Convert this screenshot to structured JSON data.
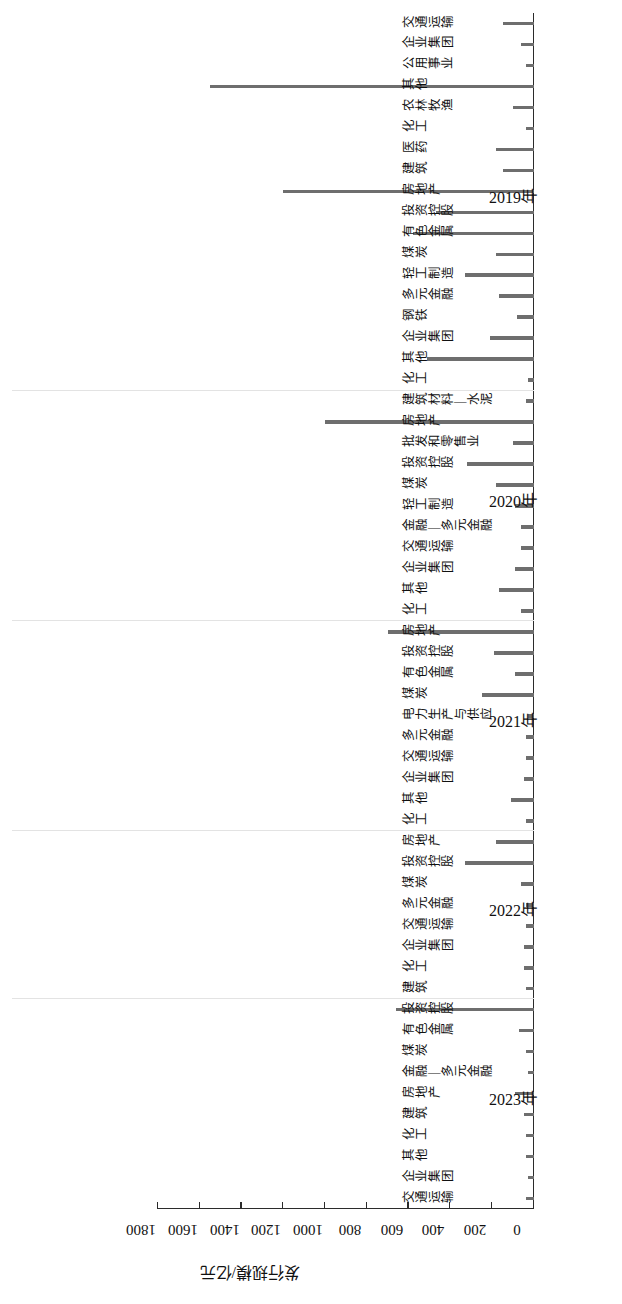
{
  "chart_data": {
    "type": "bar",
    "orientation": "horizontal",
    "title": "",
    "xlabel": "",
    "ylabel": "发行规模/亿元",
    "ylim": [
      0,
      1800
    ],
    "yticks": [
      0,
      200,
      400,
      600,
      800,
      1000,
      1200,
      1400,
      1600,
      1800
    ],
    "grid": false,
    "legend": null,
    "bar_color": "#6e6e6e",
    "group_label_suffix": "年",
    "groups": [
      {
        "year": "2019年",
        "categories": [
          "交通运输",
          "企业集团",
          "公用事业",
          "其他",
          "农林牧渔",
          "化工",
          "医药",
          "建筑",
          "房地产",
          "投资控股",
          "有色金属",
          "煤炭",
          "轻工制造",
          "多元金融",
          "钢铁",
          "企业集团",
          "其他",
          "化工"
        ],
        "values": [
          150,
          60,
          40,
          1550,
          100,
          40,
          180,
          150,
          1200,
          470,
          580,
          180,
          330,
          170,
          80,
          210,
          510,
          30
        ]
      },
      {
        "year": "2020年",
        "categories": [
          "建筑材料—水泥",
          "房地产",
          "批发和零售业",
          "投资控股",
          "煤炭",
          "轻工制造",
          "金融—多元金融",
          "交通运输",
          "企业集团",
          "其他",
          "化工"
        ],
        "values": [
          40,
          1000,
          100,
          320,
          180,
          90,
          60,
          60,
          90,
          170,
          60
        ]
      },
      {
        "year": "2021年",
        "categories": [
          "房地产",
          "投资控股",
          "有色金属",
          "煤炭",
          "电力生产与供应",
          "多元金融",
          "交通运输",
          "企业集团",
          "其他",
          "化工"
        ],
        "values": [
          700,
          190,
          90,
          250,
          30,
          40,
          40,
          50,
          110,
          40
        ]
      },
      {
        "year": "2022年",
        "categories": [
          "房地产",
          "投资控股",
          "煤炭",
          "多元金融",
          "交通运输",
          "企业集团",
          "化工",
          "建筑"
        ],
        "values": [
          180,
          330,
          60,
          40,
          40,
          50,
          50,
          40
        ]
      },
      {
        "year": "2023年",
        "categories": [
          "投资控股",
          "有色金属",
          "煤炭",
          "金融—多元金融",
          "房地产",
          "建筑",
          "化工",
          "其他",
          "企业集团",
          "交通运输"
        ],
        "values": [
          660,
          70,
          40,
          30,
          90,
          50,
          40,
          40,
          30,
          40
        ]
      }
    ]
  }
}
